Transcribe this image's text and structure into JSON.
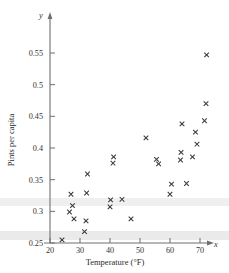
{
  "chart_data": {
    "type": "scatter",
    "title": "",
    "xlabel": "Temperature (°F)",
    "ylabel": "Pints per capita",
    "x_axis_symbol": "x",
    "y_axis_symbol": "y",
    "xlim": [
      18,
      76
    ],
    "ylim": [
      0.245,
      0.572
    ],
    "xticks": [
      20,
      30,
      40,
      50,
      60,
      70
    ],
    "xtick_labels": [
      "20",
      "30",
      "40",
      "50",
      "60",
      "70"
    ],
    "yticks": [
      0.25,
      0.3,
      0.35,
      0.4,
      0.45,
      0.5,
      0.55
    ],
    "ytick_labels": [
      "0.25",
      "0.3",
      "0.35",
      "0.4",
      "0.45",
      "0.5",
      "0.55"
    ],
    "grid": false,
    "legend": false,
    "marker": "x",
    "marker_color": "#3a3a3a",
    "points": [
      {
        "x": 24.0,
        "y": 0.255
      },
      {
        "x": 26.5,
        "y": 0.299
      },
      {
        "x": 27.0,
        "y": 0.327
      },
      {
        "x": 27.5,
        "y": 0.309
      },
      {
        "x": 28.0,
        "y": 0.288
      },
      {
        "x": 31.5,
        "y": 0.268
      },
      {
        "x": 32.0,
        "y": 0.285
      },
      {
        "x": 32.2,
        "y": 0.329
      },
      {
        "x": 32.5,
        "y": 0.359
      },
      {
        "x": 40.0,
        "y": 0.307
      },
      {
        "x": 40.2,
        "y": 0.318
      },
      {
        "x": 41.0,
        "y": 0.376
      },
      {
        "x": 41.2,
        "y": 0.386
      },
      {
        "x": 44.0,
        "y": 0.319
      },
      {
        "x": 47.0,
        "y": 0.288
      },
      {
        "x": 52.0,
        "y": 0.416
      },
      {
        "x": 55.5,
        "y": 0.382
      },
      {
        "x": 56.2,
        "y": 0.375
      },
      {
        "x": 60.0,
        "y": 0.327
      },
      {
        "x": 60.5,
        "y": 0.343
      },
      {
        "x": 63.5,
        "y": 0.381
      },
      {
        "x": 63.7,
        "y": 0.393
      },
      {
        "x": 64.0,
        "y": 0.438
      },
      {
        "x": 65.5,
        "y": 0.344
      },
      {
        "x": 67.5,
        "y": 0.386
      },
      {
        "x": 68.5,
        "y": 0.425
      },
      {
        "x": 69.0,
        "y": 0.406
      },
      {
        "x": 71.5,
        "y": 0.443
      },
      {
        "x": 72.0,
        "y": 0.47
      },
      {
        "x": 72.2,
        "y": 0.547
      }
    ]
  }
}
